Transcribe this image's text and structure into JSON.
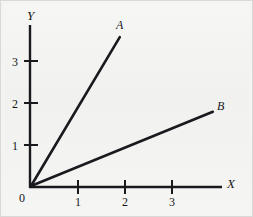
{
  "figure": {
    "background_color": "#f2f2f1",
    "ink_color": "#1a1a1e",
    "border_color": "#d9d9d7"
  },
  "chart_data": {
    "type": "line",
    "title": "",
    "subtitle": "",
    "xlabel": "X",
    "ylabel": "Y",
    "xlim": [
      0,
      4.1
    ],
    "ylim": [
      0,
      3.85
    ],
    "grid": false,
    "legend": "inline-endpoint-labels",
    "origin_label": "0",
    "xticks": [
      1,
      2,
      3
    ],
    "xtick_labels": [
      "1",
      "2",
      "3"
    ],
    "yticks": [
      1,
      2,
      3
    ],
    "ytick_labels": [
      "1",
      "2",
      "3"
    ],
    "series": [
      {
        "name": "A",
        "label": "A",
        "slope": 1.87,
        "intercept": 0,
        "x": [
          0,
          1.91
        ],
        "y": [
          0,
          3.57
        ],
        "color": "#1a1a1e",
        "line_width": 2.6
      },
      {
        "name": "B",
        "label": "B",
        "slope": 0.46,
        "intercept": 0,
        "x": [
          0,
          3.89
        ],
        "y": [
          0,
          1.79
        ],
        "color": "#1a1a1e",
        "line_width": 2.6
      }
    ]
  },
  "labels": {
    "y_axis": "Y",
    "x_axis": "X",
    "origin": "0",
    "x1": "1",
    "x2": "2",
    "x3": "3",
    "y1": "1",
    "y2": "2",
    "y3": "3",
    "series_a": "A",
    "series_b": "B"
  }
}
